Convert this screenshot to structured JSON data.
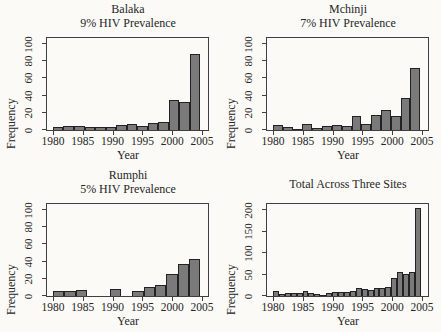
{
  "style": {
    "bar_fill": "#7a7a7a",
    "bar_border": "#222222",
    "axis_color": "#3f3f3f",
    "text_color": "#262626",
    "background": "#fbfaf7"
  },
  "chart_data": [
    {
      "type": "bar",
      "title": "Balaka",
      "subtitle": "9% HIV Prevalence",
      "xlabel": "Year",
      "ylabel": "Frequency",
      "xticks": [
        1980,
        1985,
        1990,
        1995,
        2000,
        2005
      ],
      "yticks": [
        0,
        20,
        40,
        60,
        80,
        100
      ],
      "xlim": [
        1979,
        2006
      ],
      "ylim": [
        0,
        107
      ],
      "bars_span_years": [
        1980,
        2004.7
      ],
      "grid": false,
      "legend": "none",
      "values": [
        4,
        5,
        5,
        3,
        4,
        3,
        6,
        7,
        5,
        8,
        9,
        35,
        33,
        88
      ]
    },
    {
      "type": "bar",
      "title": "Mchinji",
      "subtitle": "7% HIV Prevalence",
      "xlabel": "Year",
      "ylabel": "Frequency",
      "xticks": [
        1980,
        1985,
        1990,
        1995,
        2000,
        2005
      ],
      "yticks": [
        0,
        20,
        40,
        60,
        80,
        100
      ],
      "xlim": [
        1979,
        2006
      ],
      "ylim": [
        0,
        107
      ],
      "bars_span_years": [
        1980,
        2004.7
      ],
      "grid": false,
      "legend": "none",
      "values": [
        6,
        3,
        1,
        7,
        2,
        5,
        6,
        5,
        16,
        7,
        17,
        23,
        16,
        37,
        72
      ]
    },
    {
      "type": "bar",
      "title": "Rumphi",
      "subtitle": "5% HIV Prevalence",
      "xlabel": "Year",
      "ylabel": "Frequency",
      "xticks": [
        1980,
        1985,
        1990,
        1995,
        2000,
        2005
      ],
      "yticks": [
        0,
        20,
        40,
        60,
        80,
        100
      ],
      "xlim": [
        1979,
        2006
      ],
      "ylim": [
        0,
        107
      ],
      "bars_span_years": [
        1980,
        2004.7
      ],
      "grid": false,
      "legend": "none",
      "values": [
        6,
        6,
        7,
        0,
        0,
        8,
        0,
        6,
        10,
        13,
        26,
        37,
        43
      ]
    },
    {
      "type": "bar",
      "title": "Total Across Three Sites",
      "subtitle": "",
      "xlabel": "Year",
      "ylabel": "Frequency",
      "xticks": [
        1980,
        1985,
        1990,
        1995,
        2000,
        2005
      ],
      "yticks": [
        0,
        50,
        100,
        150,
        200
      ],
      "xlim": [
        1979,
        2006
      ],
      "ylim": [
        0,
        215
      ],
      "bars_span_years": [
        1980,
        2004.8
      ],
      "grid": false,
      "legend": "none",
      "values": [
        12,
        4,
        6,
        8,
        6,
        12,
        8,
        4,
        3,
        6,
        9,
        10,
        9,
        12,
        18,
        17,
        14,
        19,
        19,
        22,
        41,
        57,
        52,
        56,
        205
      ]
    }
  ]
}
